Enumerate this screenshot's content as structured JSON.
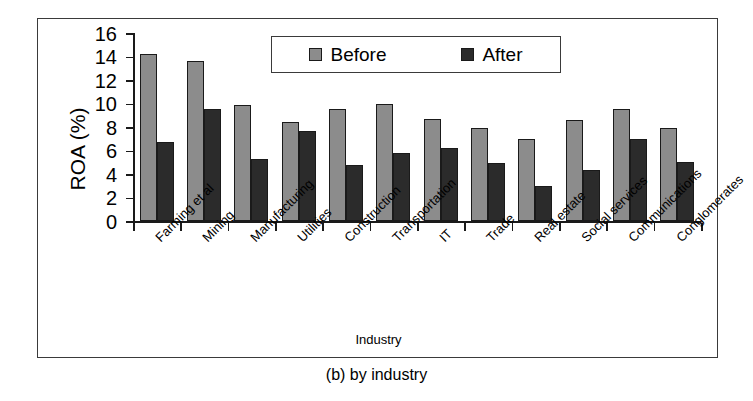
{
  "figure": {
    "caption": "(b) by industry"
  },
  "chart_data": {
    "type": "bar",
    "title": "",
    "xlabel": "Industry",
    "ylabel": "ROA (%)",
    "ylim": [
      0,
      16
    ],
    "y_ticks": [
      0,
      2,
      4,
      6,
      8,
      10,
      12,
      14,
      16
    ],
    "grid": false,
    "legend_position": "top-center",
    "categories": [
      "Farming et al",
      "Mining",
      "Manufacturing",
      "Utilities",
      "Construction",
      "Transportation",
      "IT",
      "Trade",
      "Real estate",
      "Social services",
      "Communications",
      "Conglomerates"
    ],
    "series": [
      {
        "name": "Before",
        "color": "#8c8c8c",
        "values": [
          14.2,
          13.6,
          9.9,
          8.4,
          9.5,
          10.0,
          8.7,
          7.9,
          7.0,
          8.6,
          9.5,
          7.9
        ]
      },
      {
        "name": "After",
        "color": "#2b2b2b",
        "values": [
          6.7,
          9.5,
          5.3,
          7.7,
          4.8,
          5.8,
          6.2,
          4.9,
          3.0,
          4.3,
          7.0,
          5.0
        ]
      }
    ]
  }
}
